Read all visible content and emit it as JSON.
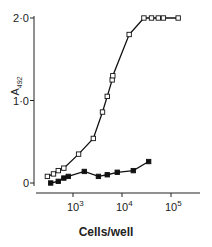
{
  "chart_data": {
    "type": "line",
    "title": "",
    "xlabel": "Cells/well",
    "ylabel": "A492",
    "ylabel_main": "A",
    "ylabel_sub": "492",
    "x_scale": "log",
    "xlim": [
      200,
      300000
    ],
    "ylim": [
      0,
      2.0
    ],
    "yticks": [
      0,
      1.0,
      2.0
    ],
    "ytick_labels": [
      "0",
      "1·0",
      "2·0"
    ],
    "xticks": [
      1000,
      10000,
      100000
    ],
    "xtick_labels": [
      {
        "base": "10",
        "exp": "3"
      },
      {
        "base": "10",
        "exp": "4"
      },
      {
        "base": "10",
        "exp": "5"
      }
    ],
    "grid": false,
    "legend": null,
    "series": [
      {
        "name": "open squares",
        "marker": "open-square",
        "x": [
          300,
          400,
          500,
          650,
          1300,
          2600,
          4000,
          5000,
          6300,
          6500,
          14000,
          28000,
          40000,
          55000,
          70000,
          140000
        ],
        "y": [
          0.08,
          0.11,
          0.15,
          0.18,
          0.35,
          0.54,
          0.86,
          1.05,
          1.25,
          1.3,
          1.8,
          2.0,
          2.0,
          2.0,
          2.0,
          2.0
        ]
      },
      {
        "name": "filled squares",
        "marker": "filled-square",
        "x": [
          350,
          500,
          650,
          800,
          1700,
          3300,
          5000,
          8000,
          17000,
          35000
        ],
        "y": [
          0.0,
          0.02,
          0.06,
          0.08,
          0.14,
          0.08,
          0.1,
          0.13,
          0.15,
          0.26
        ]
      }
    ]
  }
}
